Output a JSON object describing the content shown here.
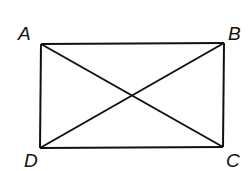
{
  "diagram": {
    "type": "rectangle-with-diagonals",
    "vertices": {
      "A": {
        "label": "A",
        "x": 41,
        "y": 44
      },
      "B": {
        "label": "B",
        "x": 224,
        "y": 43
      },
      "C": {
        "label": "C",
        "x": 223,
        "y": 147
      },
      "D": {
        "label": "D",
        "x": 40,
        "y": 148
      }
    },
    "edges": [
      [
        "A",
        "B"
      ],
      [
        "B",
        "C"
      ],
      [
        "C",
        "D"
      ],
      [
        "D",
        "A"
      ]
    ],
    "diagonals": [
      [
        "A",
        "C"
      ],
      [
        "B",
        "D"
      ]
    ],
    "stroke_color": "#111111"
  }
}
